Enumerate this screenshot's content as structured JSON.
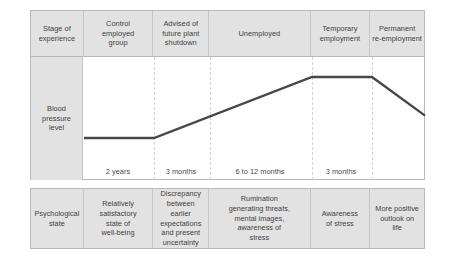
{
  "figure": {
    "row_labels": {
      "stage": "Stage of\nexperience",
      "measure": "Blood\npressure\nlevel",
      "state": "Psychological\nstate"
    },
    "columns": [
      {
        "stage": "Control\nemployed\ngroup",
        "duration": "2 years",
        "state": "Relatively\nsatisfactory\nstate of\nwell-being"
      },
      {
        "stage": "Advised of\nfuture plant\nshutdown",
        "duration": "3 months",
        "state": "Discrepancy\nbetween\nearlier\nexpectations\nand present\nuncertainty"
      },
      {
        "stage": "Unemployed",
        "duration": "6 to 12 months",
        "state": "Rumination\ngenerating threats,\nmental images,\nawareness of\nstress"
      },
      {
        "stage": "Temporary\nemployment",
        "duration": "3 months",
        "state": "Awareness\nof stress"
      },
      {
        "stage": "Permanent\nre-employment",
        "duration": "",
        "state": "More positive\noutlook on\nlife"
      }
    ],
    "colors": {
      "header_fill": "#e2e2e2",
      "cell_fill": "#e2e2e2",
      "plot_fill": "#ffffff",
      "border": "#b9b9b9",
      "divider": "#c6c6c6",
      "plot_divider": "#d2d2d2",
      "line": "#474747",
      "text": "#3f3f3f"
    }
  },
  "chart_data": {
    "type": "line",
    "xlabel": "Stage of experience",
    "ylabel": "Blood pressure level",
    "grid": false,
    "legend": null,
    "axis_tick_labels_shown": false,
    "categories": [
      "Control employed group",
      "Advised of future plant shutdown",
      "Unemployed",
      "Temporary employment",
      "Permanent re-employment"
    ],
    "category_durations": [
      "2 years",
      "3 months",
      "6 to 12 months",
      "3 months",
      ""
    ],
    "series": [
      {
        "name": "Blood pressure level",
        "values": [
          1,
          1,
          4,
          4,
          2.1
        ],
        "note": "Relative level, no numeric scale printed on the figure"
      }
    ],
    "points": [
      {
        "x": 0.0,
        "y": 1.0,
        "label": "start of control period, flat low baseline"
      },
      {
        "x": 1.0,
        "y": 1.0,
        "label": "end of control period / advised of shutdown"
      },
      {
        "x": 3.0,
        "y": 4.0,
        "label": "end of unemployment, peak reached"
      },
      {
        "x": 4.0,
        "y": 4.0,
        "label": "end of temporary employment, peak sustained"
      },
      {
        "x": 5.0,
        "y": 2.1,
        "label": "permanent re-employment, declining"
      }
    ],
    "ylim": [
      0,
      5
    ]
  }
}
